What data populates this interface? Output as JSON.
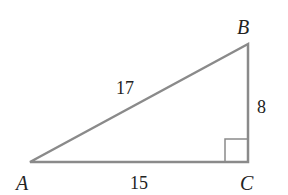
{
  "diagram": {
    "type": "right-triangle",
    "stroke_color": "#8a8a8a",
    "vertices": {
      "A": {
        "label": "A"
      },
      "B": {
        "label": "B"
      },
      "C": {
        "label": "C"
      }
    },
    "sides": {
      "AB": {
        "label": "17"
      },
      "BC": {
        "label": "8"
      },
      "AC": {
        "label": "15"
      }
    },
    "right_angle_at": "C"
  }
}
